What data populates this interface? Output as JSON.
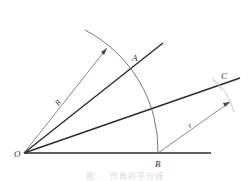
{
  "figure": {
    "type": "geometric-construction",
    "labels": {
      "O": "O",
      "A": "A",
      "B": "B",
      "C": "C",
      "R": "R",
      "r": "r"
    },
    "caption": "图 … 作角的平分线",
    "colors": {
      "thick_line": "#2b2b2b",
      "thin_line": "#555555",
      "faint_arc": "#bbbbbb",
      "label": "#333333",
      "caption": "#d8d8d8"
    },
    "points": {
      "O": [
        24,
        153
      ],
      "A": [
        133,
        69
      ],
      "B": [
        158,
        153
      ],
      "C": [
        218,
        86
      ]
    }
  }
}
